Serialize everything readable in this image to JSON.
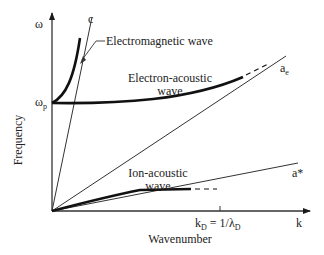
{
  "diagram": {
    "axes": {
      "y_symbol": "ω",
      "y_label": "Frequency",
      "x_symbol": "k",
      "x_label": "Wavenumber",
      "y_marker": {
        "symbol": "ω",
        "subscript": "p"
      },
      "x_marker": {
        "text_k": "k",
        "sub_k": "D",
        "text_mid": " = 1/λ",
        "sub_l": "D"
      }
    },
    "lines": {
      "light": {
        "label": "c"
      },
      "electron_thermal": {
        "label": "a",
        "subscript": "e"
      },
      "ion_sound": {
        "label": "a*"
      }
    },
    "curves": {
      "em_wave": {
        "label": "Electromagnetic wave"
      },
      "electron_acoustic": {
        "label_line1": "Electron-acoustic",
        "label_line2": "wave"
      },
      "ion_acoustic": {
        "label_line1": "Ion-acoustic",
        "label_line2": "wave"
      }
    },
    "colors": {
      "stroke": "#1a1a1a",
      "text": "#222222",
      "background": "#ffffff"
    }
  }
}
